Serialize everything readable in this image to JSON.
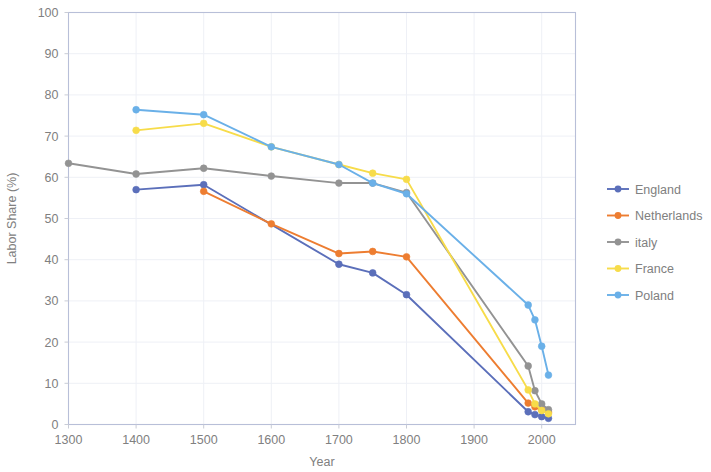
{
  "chart_data": {
    "type": "line",
    "title": "",
    "subtitle": "",
    "xlabel": "Year",
    "ylabel": "Labor Share (%)",
    "xlim": [
      1300,
      2050
    ],
    "ylim": [
      0,
      100
    ],
    "xticks": [
      1300,
      1400,
      1500,
      1600,
      1700,
      1800,
      1900,
      2000
    ],
    "yticks": [
      0,
      10,
      20,
      30,
      40,
      50,
      60,
      70,
      80,
      90,
      100
    ],
    "xtick_labels": [
      "1300",
      "1400",
      "1500",
      "1600",
      "1700",
      "1800",
      "1900",
      "2000"
    ],
    "ytick_labels": [
      "0",
      "10",
      "20",
      "30",
      "40",
      "50",
      "60",
      "70",
      "80",
      "90",
      "100"
    ],
    "grid": "horizontal-faint-and-vertical-faint",
    "legend_position": "right",
    "markers": "circle",
    "series": [
      {
        "name": "England",
        "color": "#5b6fba",
        "x": [
          1400,
          1500,
          1700,
          1750,
          1800,
          1980,
          1990,
          2000,
          2010
        ],
        "y": [
          57.0,
          58.2,
          38.9,
          36.8,
          31.5,
          3.1,
          2.4,
          1.9,
          1.5
        ]
      },
      {
        "name": "Netherlands",
        "color": "#ed7d31",
        "x": [
          1500,
          1600,
          1700,
          1750,
          1800,
          1980,
          1990,
          2000,
          2010
        ],
        "y": [
          56.6,
          48.7,
          41.5,
          42.0,
          40.7,
          5.2,
          4.3,
          3.6,
          3.0
        ]
      },
      {
        "name": "italy",
        "color": "#939393",
        "x": [
          1300,
          1400,
          1500,
          1600,
          1700,
          1750,
          1800,
          1980,
          1990,
          2000,
          2010
        ],
        "y": [
          63.4,
          60.8,
          62.2,
          60.3,
          58.6,
          58.6,
          56.3,
          14.2,
          8.2,
          5.0,
          3.6
        ]
      },
      {
        "name": "France",
        "color": "#f7dc4a",
        "x": [
          1400,
          1500,
          1600,
          1700,
          1750,
          1800,
          1980,
          1990,
          2000,
          2010
        ],
        "y": [
          71.4,
          73.1,
          67.4,
          63.1,
          61.0,
          59.5,
          8.4,
          5.0,
          3.4,
          2.6
        ]
      },
      {
        "name": "Poland",
        "color": "#6ab0e8",
        "x": [
          1400,
          1500,
          1600,
          1700,
          1750,
          1800,
          1980,
          1990,
          2000,
          2010
        ],
        "y": [
          76.4,
          75.2,
          67.4,
          63.1,
          58.6,
          56.0,
          29.0,
          25.4,
          19.0,
          12.0
        ]
      }
    ]
  },
  "legend": {
    "items": [
      {
        "label": "England",
        "color": "#5b6fba"
      },
      {
        "label": "Netherlands",
        "color": "#ed7d31"
      },
      {
        "label": "italy",
        "color": "#939393"
      },
      {
        "label": "France",
        "color": "#f7dc4a"
      },
      {
        "label": "Poland",
        "color": "#6ab0e8"
      }
    ]
  },
  "axes": {
    "x_title": "Year",
    "y_title": "Labor Share (%)"
  }
}
